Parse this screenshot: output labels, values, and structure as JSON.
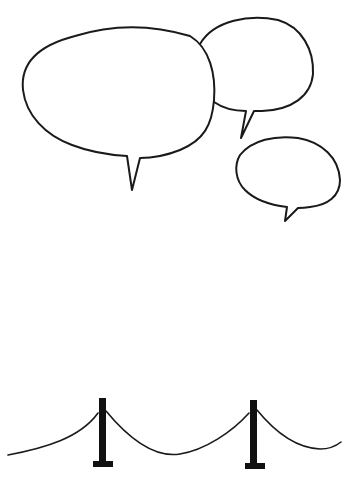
{
  "scene": {
    "description": "Hand-drawn empty speech bubbles above a rope barrier with two stanchion posts",
    "colors": {
      "background": "#ffffff",
      "ink": "#1a1a1a"
    },
    "speech_bubbles": [
      {
        "id": "large",
        "text": ""
      },
      {
        "id": "medium-top-right",
        "text": ""
      },
      {
        "id": "small-right",
        "text": ""
      }
    ],
    "barrier": {
      "posts": 2,
      "rope_segments": 3
    }
  }
}
